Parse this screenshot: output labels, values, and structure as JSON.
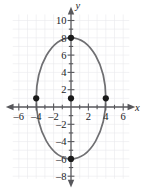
{
  "chart_data": {
    "type": "line",
    "title": "",
    "subtitle": "",
    "xlabel": "x",
    "ylabel": "y",
    "grid": true,
    "legend": "none",
    "xlim": [
      -7.2,
      7.2
    ],
    "ylim": [
      -8.6,
      11.2
    ],
    "x_ticks": [
      -6,
      -4,
      -2,
      2,
      4,
      6
    ],
    "y_ticks": [
      10,
      8,
      6,
      4,
      2,
      -2,
      -4,
      -6,
      -8
    ],
    "x_tick_labels": [
      "–6",
      "–4",
      "–2",
      "2",
      "4",
      "6"
    ],
    "y_tick_labels": [
      "10",
      "8",
      "6",
      "4",
      "2",
      "–2",
      "–4",
      "–6",
      "–8"
    ],
    "x_tick_step": 1,
    "y_tick_step": 1,
    "curve": {
      "name": "ellipse",
      "equation": "x^2/16 + (y-1)^2/49 = 1",
      "center": [
        0,
        1
      ],
      "semi_axis_x": 4,
      "semi_axis_y": 7,
      "color": "#6f6f72"
    },
    "points": [
      {
        "label": "top-vertex",
        "x": 0,
        "y": 8
      },
      {
        "label": "bottom-vertex",
        "x": 0,
        "y": -6
      },
      {
        "label": "left-vertex",
        "x": -4,
        "y": 1
      },
      {
        "label": "right-vertex",
        "x": 4,
        "y": 1
      },
      {
        "label": "center",
        "x": 0,
        "y": 1
      }
    ],
    "point_color": "#1a1a1a",
    "grid_color": "#e9e9ec",
    "axis_color": "#58585c"
  }
}
